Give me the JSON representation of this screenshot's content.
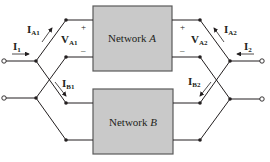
{
  "diagram": {
    "colors": {
      "wire": "#231f20",
      "box_fill": "#c9c9c9",
      "box_stroke": "#5a5a5a",
      "text": "#231f20"
    },
    "networks": [
      {
        "id": "A",
        "label_prefix": "Network ",
        "label_letter": "A"
      },
      {
        "id": "B",
        "label_prefix": "Network ",
        "label_letter": "B"
      }
    ],
    "currents": {
      "I1": {
        "main": "I",
        "sub": "1"
      },
      "I2": {
        "main": "I",
        "sub": "2"
      },
      "IA1": {
        "main": "I",
        "sub": "A1"
      },
      "IA2": {
        "main": "I",
        "sub": "A2"
      },
      "IB1": {
        "main": "I",
        "sub": "B1"
      },
      "IB2": {
        "main": "I",
        "sub": "B2"
      }
    },
    "voltages": {
      "VA1": {
        "main": "V",
        "sub": "A1"
      },
      "VA2": {
        "main": "V",
        "sub": "A2"
      }
    },
    "polarity": {
      "plus": "+",
      "minus": "–"
    }
  }
}
